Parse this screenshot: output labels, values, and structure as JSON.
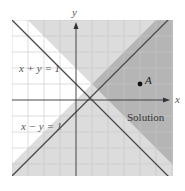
{
  "diagram": {
    "title": "",
    "axes": {
      "x_label": "x",
      "y_label": "y"
    },
    "unit_px": 16,
    "origin_px": [
      76,
      100
    ],
    "x_range": [
      -4,
      6
    ],
    "y_range": [
      -4.75,
      5
    ],
    "lines": [
      {
        "equation": "x + y = 1",
        "label": "x + y = 1"
      },
      {
        "equation": "x − y = 1",
        "label": "x − y = 1"
      }
    ],
    "regions": {
      "solution_label": "Solution",
      "solution_color": "#b5b5b5",
      "half_shaded_color": "#dcdcdc",
      "unshaded_color": "#ffffff"
    },
    "point": {
      "label": "A",
      "x": 4,
      "y": 1
    },
    "colors": {
      "line": "#4a4a4a",
      "grid": "#cfcfcf",
      "axis": "#333333"
    }
  }
}
